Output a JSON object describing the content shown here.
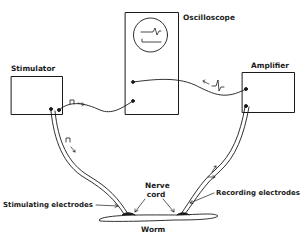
{
  "diagram": {
    "labels": {
      "oscilloscope": "Oscilloscope",
      "stimulator": "Stimulator",
      "amplifier": "Amplifier",
      "nerve_cord_line1": "Nerve",
      "nerve_cord_line2": "cord",
      "stimulating_electrodes": "Stimulating electrodes",
      "recording_electrodes": "Recording electrodes",
      "worm": "Worm"
    },
    "nodes": [
      {
        "id": "stimulator",
        "label": "Stimulator"
      },
      {
        "id": "oscilloscope",
        "label": "Oscilloscope"
      },
      {
        "id": "amplifier",
        "label": "Amplifier"
      },
      {
        "id": "stimulating-electrodes",
        "label": "Stimulating electrodes"
      },
      {
        "id": "recording-electrodes",
        "label": "Recording electrodes"
      },
      {
        "id": "worm",
        "label": "Worm"
      }
    ],
    "edges": [
      {
        "from": "stimulator",
        "to": "oscilloscope",
        "signal": "square pulse"
      },
      {
        "from": "stimulator",
        "to": "stimulating-electrodes",
        "signal": "square pulse"
      },
      {
        "from": "recording-electrodes",
        "to": "amplifier",
        "signal": "action potential"
      },
      {
        "from": "amplifier",
        "to": "oscilloscope",
        "signal": "action potential"
      }
    ],
    "colors": {
      "ink": "#1a1a1a",
      "paper": "#ffffff"
    }
  }
}
